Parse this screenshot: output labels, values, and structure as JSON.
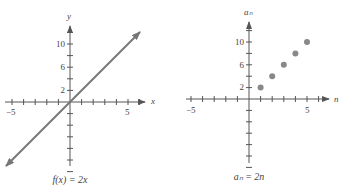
{
  "chart_data": [
    {
      "type": "line",
      "title": "f(x) = 2x",
      "xlabel": "x",
      "ylabel": "y",
      "x": [
        -6,
        6
      ],
      "values": [
        -12,
        12
      ],
      "xlim": [
        -6,
        6
      ],
      "ylim": [
        -12,
        12
      ],
      "x_tick_labels": [
        "-5",
        "5"
      ],
      "y_tick_labels": [
        "2",
        "6",
        "10"
      ],
      "grid": false,
      "arrows_both_ends": true
    },
    {
      "type": "scatter",
      "title": "a_n = 2n",
      "xlabel": "n",
      "ylabel": "a_n",
      "x": [
        1,
        2,
        3,
        4,
        5
      ],
      "values": [
        2,
        4,
        6,
        8,
        10
      ],
      "xlim": [
        -6,
        6
      ],
      "ylim": [
        -12,
        12
      ],
      "x_tick_labels": [
        "-5",
        "5"
      ],
      "y_tick_labels": [
        "2",
        "6",
        "10"
      ],
      "grid": false
    }
  ],
  "left": {
    "caption": "f(x) = 2x",
    "x_axis_label": "x",
    "y_axis_label": "y",
    "x_tick_labels": {
      "neg": "−5",
      "pos": "5"
    },
    "y_tick_labels": [
      "2",
      "6",
      "10"
    ]
  },
  "right": {
    "caption": "aₙ = 2n",
    "x_axis_label": "n",
    "y_axis_label": "aₙ",
    "x_tick_labels": {
      "neg": "−5",
      "pos": "5"
    },
    "y_tick_labels": [
      "2",
      "6",
      "10"
    ]
  },
  "colors": {
    "axis": "#555555",
    "line": "#777777",
    "points": "#888888"
  }
}
